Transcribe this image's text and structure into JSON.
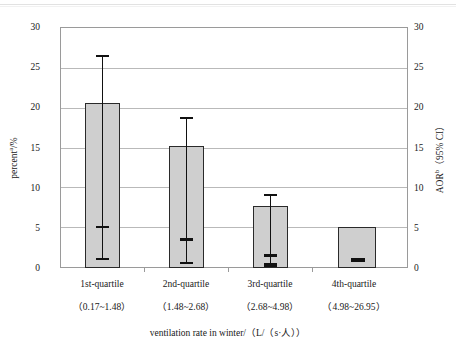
{
  "chart_data": {
    "type": "bar",
    "title": "",
    "xlabel": "ventilation rate in winter/（L/（s·人））",
    "ylabel_left": "percent/%",
    "ylabel_left_superscript": "a",
    "ylabel_right": "AOR（95% CI）",
    "ylabel_right_superscript": "b",
    "categories": [
      "1st-quartile",
      "2nd-quartile",
      "3rd-quartile",
      "4th-quartile"
    ],
    "category_ranges": [
      "（0.17~1.48）",
      "（1.48~2.68）",
      "（2.68~4.98）",
      "（4.98~26.95）"
    ],
    "values": [
      20.4,
      15.2,
      7.7,
      5.1
    ],
    "series": [
      {
        "name": "percent",
        "axis": "left",
        "values": [
          20.4,
          15.2,
          7.7,
          5.1
        ]
      },
      {
        "name": "AOR (95% CI)",
        "axis": "right",
        "values": [
          5.2,
          3.6,
          1.5,
          1.0
        ],
        "ci_low": [
          1.1,
          0.7,
          0.3,
          null
        ],
        "ci_high": [
          26.4,
          18.7,
          9.1,
          null
        ]
      }
    ],
    "ylim": [
      0,
      30
    ],
    "yticks": [
      0,
      5,
      10,
      15,
      20,
      25,
      30
    ],
    "ylim_right": [
      0,
      30
    ],
    "yticks_right": [
      0,
      5,
      10,
      15,
      20,
      25,
      30
    ],
    "grid": true,
    "legend": "none",
    "bar_color": "#cfcfcf",
    "bar_edge_color": "#2a2a2a",
    "error_bar_color": "#111111"
  },
  "axis": {
    "left_ticks": [
      "30",
      "25",
      "20",
      "15",
      "10",
      "5",
      "0"
    ],
    "right_ticks": [
      "30",
      "25",
      "20",
      "15",
      "10",
      "5",
      "0"
    ]
  }
}
